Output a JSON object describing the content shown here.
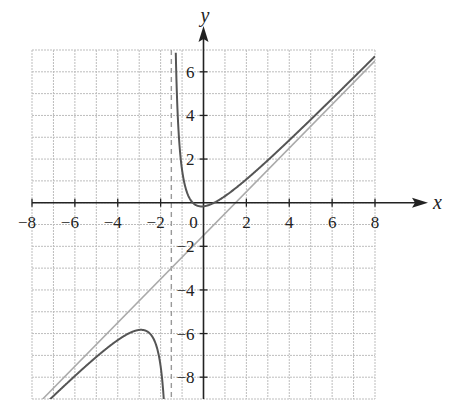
{
  "chart_data": {
    "type": "line",
    "title": "",
    "xlabel": "x",
    "ylabel": "y",
    "xlim": [
      -8,
      8
    ],
    "ylim": [
      -9,
      7
    ],
    "grid": true,
    "grid_step": 1,
    "x_ticks": [
      -8,
      -6,
      -4,
      -2,
      0,
      2,
      4,
      6,
      8
    ],
    "x_tick_labels": [
      "−8",
      "−6",
      "−4",
      "−2",
      "0",
      "2",
      "4",
      "6",
      "8"
    ],
    "y_ticks": [
      -8,
      -6,
      -4,
      -2,
      2,
      4,
      6
    ],
    "y_tick_labels": [
      "−8",
      "−6",
      "−4",
      "−2",
      "2",
      "4",
      "6"
    ],
    "series": [
      {
        "name": "f(x)",
        "style": "solid",
        "color": "#555555",
        "description": "rational function with vertical asymptote x = -1.5 and slant asymptote y = x - 1.5",
        "model": {
          "slope": 1,
          "intercept": -1.5,
          "pole": -1.5,
          "coef": 2
        },
        "key_points": [
          {
            "label": "local max",
            "x": -2.9,
            "y": -5.7
          },
          {
            "label": "local min",
            "x": -0.1,
            "y": -0.2
          }
        ]
      },
      {
        "name": "slant asymptote",
        "style": "solid",
        "color": "#aaaaaa",
        "equation": "y = x - 1.5",
        "x": [
          -8,
          8
        ],
        "y": [
          -9.5,
          6.5
        ]
      },
      {
        "name": "vertical asymptote",
        "style": "dashed",
        "color": "#999999",
        "equation": "x = -1.5"
      }
    ]
  },
  "colors": {
    "grid": "#bdbdbd",
    "axis": "#222222",
    "curve": "#555555",
    "slant": "#aaaaaa",
    "vertical": "#999999"
  }
}
